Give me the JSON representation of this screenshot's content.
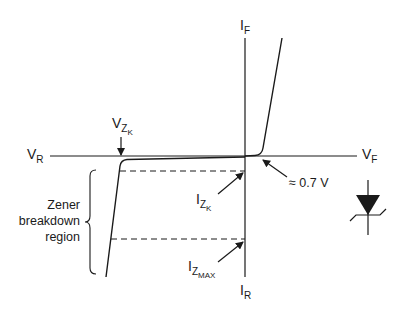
{
  "diagram": {
    "axes": {
      "top": {
        "main": "I",
        "sub": "F"
      },
      "bottom": {
        "main": "I",
        "sub": "R"
      },
      "left": {
        "main": "V",
        "sub": "R"
      },
      "right": {
        "main": "V",
        "sub": "F"
      }
    },
    "annotations": {
      "vzk": {
        "main": "V",
        "sub": "Z",
        "subsub": "K"
      },
      "izk": {
        "main": "I",
        "sub": "Z",
        "subsub": "K"
      },
      "izmax": {
        "main": "I",
        "sub": "Z",
        "subsub": "MAX"
      },
      "forward_voltage": "≈ 0.7 V",
      "region_label": [
        "Zener",
        "breakdown",
        "region"
      ]
    },
    "symbol": "zener-diode-symbol",
    "colors": {
      "line": "#1a1a1a",
      "background": "#ffffff"
    }
  }
}
